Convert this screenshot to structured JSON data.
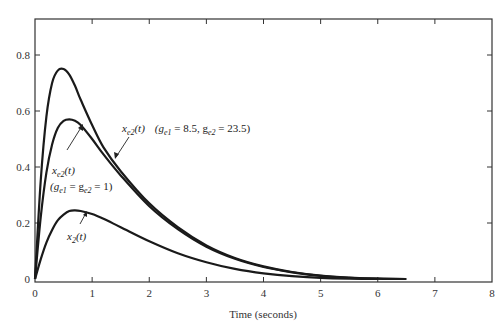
{
  "chart_data": {
    "type": "line",
    "title": "",
    "xlabel": "Time (seconds)",
    "ylabel": "",
    "xlim": [
      0,
      8
    ],
    "ylim": [
      0,
      0.9
    ],
    "grid": false,
    "legend": "none (curves labeled by annotations)",
    "x_ticks": [
      "0",
      "1",
      "2",
      "3",
      "4",
      "5",
      "6",
      "7",
      "8"
    ],
    "y_ticks": [
      "0",
      "0.2",
      "0.4",
      "0.6",
      "0.8"
    ],
    "series": [
      {
        "name": "x_e2(t) (g_e1 = 8.5, g_e2 = 23.5)",
        "x": [
          0,
          0.1,
          0.2,
          0.3,
          0.4,
          0.5,
          0.6,
          0.7,
          0.8,
          1.0,
          1.2,
          1.5,
          2.0,
          2.5,
          3.0,
          3.5,
          4.0,
          4.5,
          5.0,
          5.5,
          6.0,
          6.5
        ],
        "y": [
          0,
          0.35,
          0.58,
          0.7,
          0.745,
          0.75,
          0.73,
          0.69,
          0.64,
          0.55,
          0.47,
          0.385,
          0.27,
          0.185,
          0.12,
          0.075,
          0.045,
          0.025,
          0.012,
          0.005,
          0.001,
          0
        ]
      },
      {
        "name": "x_e2(t) (g_e1 = g_e2 = 1)",
        "x": [
          0,
          0.1,
          0.2,
          0.3,
          0.4,
          0.5,
          0.6,
          0.7,
          0.8,
          1.0,
          1.2,
          1.5,
          2.0,
          2.5,
          3.0,
          3.5,
          4.0,
          4.5,
          5.0,
          5.5,
          6.0,
          6.5
        ],
        "y": [
          0,
          0.22,
          0.38,
          0.48,
          0.54,
          0.565,
          0.57,
          0.565,
          0.55,
          0.5,
          0.445,
          0.37,
          0.26,
          0.178,
          0.115,
          0.072,
          0.043,
          0.024,
          0.011,
          0.004,
          0.001,
          0
        ]
      },
      {
        "name": "x_2(t)",
        "x": [
          0,
          0.1,
          0.2,
          0.3,
          0.4,
          0.5,
          0.6,
          0.7,
          0.8,
          1.0,
          1.2,
          1.5,
          2.0,
          2.5,
          3.0,
          3.5,
          4.0,
          4.5,
          5.0,
          5.5,
          6.0
        ],
        "y": [
          0,
          0.07,
          0.13,
          0.175,
          0.21,
          0.23,
          0.243,
          0.245,
          0.243,
          0.232,
          0.215,
          0.185,
          0.135,
          0.092,
          0.06,
          0.036,
          0.02,
          0.01,
          0.004,
          0.001,
          0
        ]
      }
    ],
    "annotations": [
      {
        "text": "x_e2(t)   (g_e1 = 8.5, g_e2 = 23.5)",
        "points_to": "x_e2(t) high-gain curve"
      },
      {
        "text": "x_e2(t)",
        "points_to": "x_e2(t) unit-gain curve"
      },
      {
        "text": "(g_e1 = g_e2 = 1)",
        "points_to": "x_e2(t) unit-gain curve"
      },
      {
        "text": "x_2(t)",
        "points_to": "x_2(t) curve"
      }
    ]
  },
  "labels": {
    "xlabel": "Time (seconds)",
    "x_ticks": [
      "0",
      "1",
      "2",
      "3",
      "4",
      "5",
      "6",
      "7",
      "8"
    ],
    "y_ticks": [
      "0",
      "0.2",
      "0.4",
      "0.6",
      "0.8"
    ],
    "annot_high": {
      "main": "x",
      "sub": "e2",
      "arg": "(t)",
      "params_open": "(g",
      "p1sub": "e1",
      "p1val": " = 8.5, g",
      "p2sub": "e2",
      "p2val": " = 23.5)"
    },
    "annot_unit": {
      "main": "x",
      "sub": "e2",
      "arg": "(t)",
      "params_open": "(g",
      "p1sub": "e1",
      "mid": " = g",
      "p2sub": "e2",
      "close": " = 1)"
    },
    "annot_x2": {
      "main": "x",
      "sub": "2",
      "arg": "(t)"
    }
  },
  "colors": {
    "curve": "#1a1a1a",
    "axis": "#333333",
    "background": "#ffffff"
  }
}
